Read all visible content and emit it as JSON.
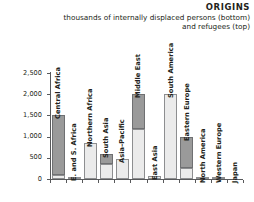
{
  "header": {
    "title": "ORIGINS",
    "subtitle_line1": "thousands of internally displaced persons (bottom)",
    "subtitle_line2": "and refugees (top)"
  },
  "chart_data": {
    "type": "bar",
    "stacked": true,
    "title": "ORIGINS",
    "subtitle": "thousands of internally displaced persons (bottom) and refugees (top)",
    "xlabel": "",
    "ylabel": "",
    "ylim": [
      0,
      2500
    ],
    "yticks": [
      0,
      500,
      1000,
      1500,
      2000,
      2500
    ],
    "ytick_labels": [
      "0",
      "500",
      "1,000",
      "1,500",
      "2,000",
      "2,500"
    ],
    "grid": false,
    "legend": "none",
    "categories": [
      "Central Africa",
      "E. and S. Africa",
      "Northern Africa",
      "South Asia",
      "Asia–Pacific",
      "Middle East",
      "East Asia",
      "South America",
      "Eastern Europe",
      "North America",
      "Western Europe",
      "Japan"
    ],
    "series": [
      {
        "name": "internally displaced persons (bottom)",
        "color": "#ebebeb",
        "values": [
          100,
          40,
          850,
          350,
          480,
          1180,
          75,
          2000,
          270,
          8,
          6,
          0
        ]
      },
      {
        "name": "refugees (top)",
        "color": "#9a9a9a",
        "values": [
          1400,
          10,
          0,
          240,
          0,
          820,
          0,
          0,
          730,
          0,
          0,
          0
        ]
      }
    ],
    "totals": [
      1500,
      50,
      850,
      590,
      480,
      2000,
      75,
      2000,
      1000,
      8,
      6,
      0
    ]
  },
  "colors": {
    "axis": "#58595b",
    "text": "#231f20",
    "bar_bottom": "#ebebeb",
    "bar_top": "#9a9a9a",
    "bar_outline": "#8d8e90",
    "background": "#ffffff"
  }
}
